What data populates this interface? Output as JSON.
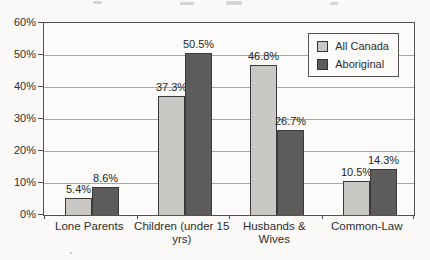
{
  "chart_data": {
    "type": "bar",
    "categories": [
      "Lone Parents",
      "Children (under 15 yrs)",
      "Husbands & Wives",
      "Common-Law"
    ],
    "series": [
      {
        "name": "All Canada",
        "color": "#c9c8c5",
        "values": [
          5.4,
          37.3,
          46.8,
          10.5
        ]
      },
      {
        "name": "Aboriginal",
        "color": "#5d5c5a",
        "values": [
          8.6,
          50.5,
          26.7,
          14.3
        ]
      }
    ],
    "value_labels": [
      [
        "5.4%",
        "37.3%",
        "46.8%",
        "10.5%"
      ],
      [
        "8.6%",
        "50.5%",
        "26.7%",
        "14.3%"
      ]
    ],
    "title": "",
    "xlabel": "",
    "ylabel": "",
    "ylim": [
      0,
      60
    ],
    "ytick_step": 10,
    "ytick_labels": [
      "0%",
      "10%",
      "20%",
      "30%",
      "40%",
      "50%",
      "60%"
    ],
    "grid": true,
    "legend_position": "top-right-inside",
    "colors": {
      "grid": "#a9a7a3",
      "plot_border": "#555250",
      "background": "#faf9f7",
      "text": "#2e2e2e"
    }
  }
}
